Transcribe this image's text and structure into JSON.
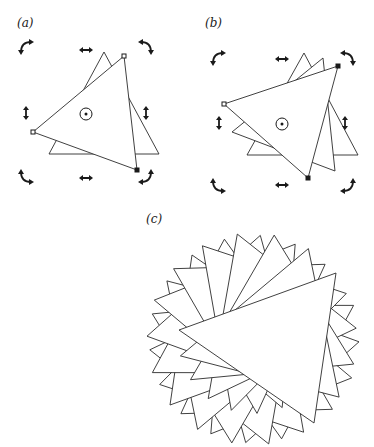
{
  "figure": {
    "panels": [
      {
        "id": "a",
        "label": "(a)",
        "label_pos": [
          17,
          27
        ],
        "pivot": [
          86,
          114
        ],
        "pivot_radius": 6,
        "triangles": [
          [
            [
              104,
              52
            ],
            [
              49,
              154
            ],
            [
              159,
              154
            ]
          ],
          [
            [
              124,
              56
            ],
            [
              33,
              132
            ],
            [
              137,
              170
            ]
          ]
        ],
        "selected_triangle_handles": [
          {
            "pos": [
              124,
              56
            ],
            "style": "hollow"
          },
          {
            "pos": [
              33,
              132
            ],
            "style": "hollow"
          },
          {
            "pos": [
              137,
              170
            ],
            "style": "filled"
          }
        ],
        "scale_handles": [
          {
            "pos": [
              86,
              50
            ],
            "icon": "horizontal-double-arrow"
          },
          {
            "pos": [
              86,
              178
            ],
            "icon": "horizontal-double-arrow"
          },
          {
            "pos": [
              26,
              113
            ],
            "icon": "vertical-double-arrow"
          },
          {
            "pos": [
              146,
              113
            ],
            "icon": "vertical-double-arrow"
          }
        ],
        "rotate_handles": [
          {
            "pos": [
              26,
              47
            ],
            "corner": "top-left"
          },
          {
            "pos": [
              146,
              47
            ],
            "corner": "top-right"
          },
          {
            "pos": [
              26,
              177
            ],
            "corner": "bottom-left"
          },
          {
            "pos": [
              146,
              177
            ],
            "corner": "bottom-right"
          }
        ]
      },
      {
        "id": "b",
        "label": "(b)",
        "label_pos": [
          205,
          27
        ],
        "pivot": [
          282,
          124
        ],
        "pivot_radius": 6,
        "triangles": [
          [
            [
              304,
              53
            ],
            [
              247,
              155
            ],
            [
              358,
              155
            ]
          ],
          [
            [
              323,
              58
            ],
            [
              232,
              132
            ],
            [
              335,
              171
            ]
          ],
          [
            [
              338,
              66
            ],
            [
              224,
              104
            ],
            [
              308,
              178
            ]
          ]
        ],
        "selected_triangle_handles": [
          {
            "pos": [
              338,
              66
            ],
            "style": "filled"
          },
          {
            "pos": [
              224,
              104
            ],
            "style": "hollow"
          },
          {
            "pos": [
              308,
              178
            ],
            "style": "filled"
          }
        ],
        "scale_handles": [
          {
            "pos": [
              282,
              59
            ],
            "icon": "horizontal-double-arrow"
          },
          {
            "pos": [
              282,
              185
            ],
            "icon": "horizontal-double-arrow"
          },
          {
            "pos": [
              219,
              123
            ],
            "icon": "vertical-double-arrow"
          },
          {
            "pos": [
              345,
              123
            ],
            "icon": "vertical-double-arrow"
          }
        ],
        "rotate_handles": [
          {
            "pos": [
              218,
              58
            ],
            "corner": "top-left"
          },
          {
            "pos": [
              348,
              58
            ],
            "corner": "top-right"
          },
          {
            "pos": [
              218,
              186
            ],
            "corner": "bottom-left"
          },
          {
            "pos": [
              348,
              186
            ],
            "corner": "bottom-right"
          }
        ]
      },
      {
        "id": "c",
        "label": "(c)",
        "label_pos": [
          146,
          223
        ],
        "pivot": [
          253,
          339
        ],
        "base_triangle_relative": [
          [
            -74,
            -9
          ],
          [
            83,
            -66
          ],
          [
            61,
            84
          ]
        ],
        "rotation_step_deg": 20,
        "copies": 18
      }
    ]
  }
}
